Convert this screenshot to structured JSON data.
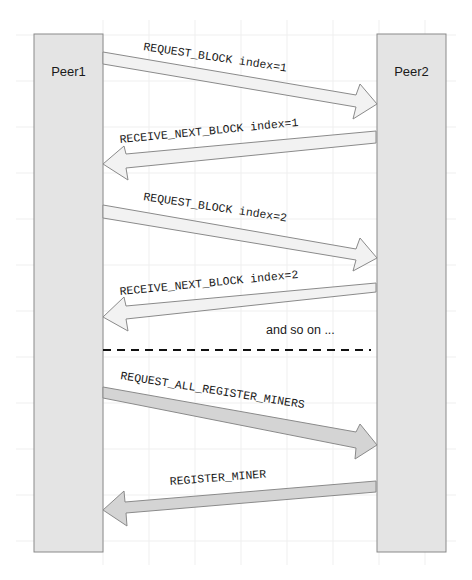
{
  "diagram": {
    "type": "sequence-diagram",
    "colors": {
      "background": "#ffffff",
      "grid": "#ececec",
      "lifeline_fill": "#e4e4e4",
      "lifeline_stroke": "#8a8a8a",
      "arrow_light_fill": "#f2f2f2",
      "arrow_dark_fill": "#d4d4d4",
      "arrow_stroke": "#8a8a8a",
      "separator": "#111111"
    },
    "participants": [
      {
        "id": "peer1",
        "label": "Peer1"
      },
      {
        "id": "peer2",
        "label": "Peer2"
      }
    ],
    "messages": [
      {
        "from": "Peer1",
        "to": "Peer2",
        "label": "REQUEST_BLOCK index=1",
        "style": "light"
      },
      {
        "from": "Peer2",
        "to": "Peer1",
        "label": "RECEIVE_NEXT_BLOCK index=1",
        "style": "light"
      },
      {
        "from": "Peer1",
        "to": "Peer2",
        "label": "REQUEST_BLOCK index=2",
        "style": "light"
      },
      {
        "from": "Peer2",
        "to": "Peer1",
        "label": "RECEIVE_NEXT_BLOCK index=2",
        "style": "light"
      },
      {
        "from": "Peer1",
        "to": "Peer2",
        "label": "REQUEST_ALL_REGISTER_MINERS",
        "style": "dark"
      },
      {
        "from": "Peer2",
        "to": "Peer1",
        "label": "REGISTER_MINER",
        "style": "dark"
      }
    ],
    "note": "and so on ...",
    "separator": "dashed"
  }
}
